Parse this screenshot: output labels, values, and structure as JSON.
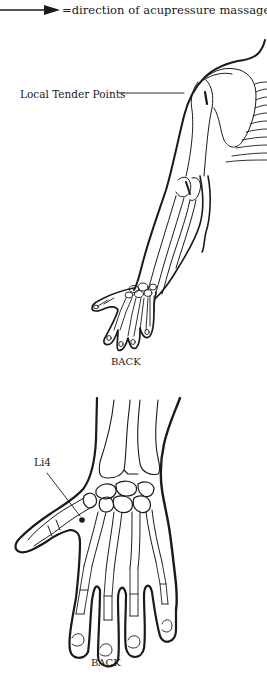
{
  "legend": {
    "arrow_icon": "right-arrow-icon",
    "text": "=direction of acupressure massage"
  },
  "figure_arm": {
    "callout_label": "Local Tender Points",
    "view_label": "BACK"
  },
  "figure_hand": {
    "point_label": "Li4",
    "view_label": "BACK"
  },
  "colors": {
    "ink": "#1a1a1a",
    "background": "#ffffff"
  }
}
